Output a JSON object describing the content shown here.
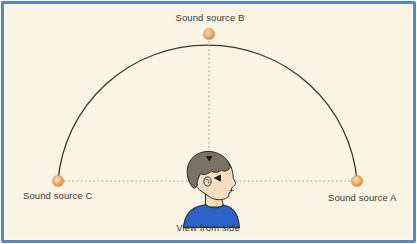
{
  "figure": {
    "caption": "View from side"
  },
  "labels": {
    "source_b": "Sound source B",
    "source_a": "Sound source A",
    "source_c": "Sound source C"
  },
  "panel": {
    "background": "#f9f4e3",
    "border_color": "#5886c4"
  },
  "colors": {
    "arc": "#3a382f",
    "dotted_line": "#a8a392",
    "text": "#3a382f",
    "dot_center": "#fce4c2",
    "dot_mid": "#f0b274",
    "dot_edge": "#de8a3c",
    "hair": "#7a7164",
    "skin": "#f4dfc0",
    "shirt": "#2b63c8",
    "outline": "#2e2c26",
    "arrow": "#1e1d18"
  },
  "diagram": {
    "arc": {
      "rx": 150,
      "ry": 148
    },
    "sources": [
      {
        "id": "C",
        "x": 58,
        "y": 181
      },
      {
        "id": "B",
        "x": 209,
        "y": 34
      },
      {
        "id": "A",
        "x": 357,
        "y": 181
      }
    ]
  }
}
